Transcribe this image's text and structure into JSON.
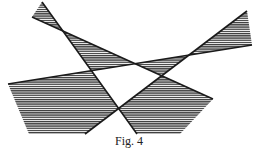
{
  "caption": "Fig. 4",
  "colors": {
    "line": "#1a1a1a",
    "hatch": "#3a3a3a",
    "background": "#ffffff"
  },
  "lines": [
    {
      "id": "L1",
      "from": [
        42,
        2
      ],
      "to": [
        137,
        134
      ]
    },
    {
      "id": "L2",
      "from": [
        32,
        17
      ],
      "to": [
        213,
        99
      ]
    },
    {
      "id": "L3",
      "from": [
        247,
        11
      ],
      "to": [
        85,
        134
      ]
    },
    {
      "id": "L4",
      "from": [
        252,
        45
      ],
      "to": [
        8,
        84
      ]
    }
  ],
  "shaded_regions": [
    {
      "name": "top-left-wedge",
      "points": [
        [
          42,
          2
        ],
        [
          32,
          17
        ],
        [
          62.9,
          31.0
        ]
      ]
    },
    {
      "name": "upper-middle-band",
      "points": [
        [
          62.9,
          31.0
        ],
        [
          135.1,
          63.7
        ],
        [
          91.4,
          70.7
        ]
      ]
    },
    {
      "name": "center-right-band",
      "points": [
        [
          135.1,
          63.7
        ],
        [
          188.9,
          55.1
        ],
        [
          161.7,
          75.8
        ]
      ]
    },
    {
      "name": "top-right-wedge",
      "points": [
        [
          247,
          11
        ],
        [
          252,
          45
        ],
        [
          188.9,
          55.1
        ]
      ]
    },
    {
      "name": "bottom-left-polygon",
      "points": [
        [
          8,
          84
        ],
        [
          91.4,
          70.7
        ],
        [
          118.6,
          108.5
        ],
        [
          85,
          134
        ],
        [
          29,
          134
        ]
      ]
    },
    {
      "name": "bottom-right-polygon",
      "points": [
        [
          161.7,
          75.8
        ],
        [
          213,
          99
        ],
        [
          180,
          134
        ],
        [
          137,
          134
        ],
        [
          118.6,
          108.5
        ]
      ]
    }
  ]
}
